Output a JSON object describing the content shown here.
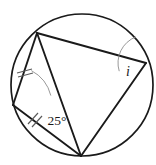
{
  "figure": {
    "type": "geometry-diagram",
    "canvas": {
      "width": 156,
      "height": 165
    },
    "colors": {
      "stroke": "#1a1a1a",
      "background": "#ffffff",
      "arc": "#8d8d8d",
      "tick": "#5a5a5a"
    }
  },
  "circle": {
    "name": "circumscribed-circle",
    "center_x": 82,
    "center_y": 85,
    "radius": 71
  },
  "vertices": [
    {
      "id": "A",
      "role": "top-left-vertex",
      "x": 37,
      "y": 33
    },
    {
      "id": "B",
      "role": "right-vertex",
      "x": 146,
      "y": 63
    },
    {
      "id": "C",
      "role": "bottom-vertex",
      "x": 81,
      "y": 156
    },
    {
      "id": "D",
      "role": "left-vertex",
      "x": 13,
      "y": 105
    }
  ],
  "segments": [
    {
      "name": "chord-top",
      "from": "A",
      "to": "B",
      "ticks": 0
    },
    {
      "name": "chord-right",
      "from": "B",
      "to": "C",
      "ticks": 0
    },
    {
      "name": "chord-bottom-left",
      "from": "C",
      "to": "D",
      "ticks": 2
    },
    {
      "name": "chord-left",
      "from": "D",
      "to": "A",
      "ticks": 2
    },
    {
      "name": "diagonal-a-c",
      "from": "A",
      "to": "C",
      "ticks": 0
    },
    {
      "name": "diagonal-d-... ",
      "from": "D",
      "to": "A",
      "ticks": 0
    }
  ],
  "angles": [
    {
      "name": "angle-25-degrees",
      "label": "25°",
      "value": 25,
      "unit": "degrees",
      "at_vertex": "D",
      "label_x": 57,
      "label_y": 122,
      "arc": {
        "cx": 13,
        "cy": 105,
        "r": 39,
        "start_deg": -62,
        "end_deg": -14
      }
    },
    {
      "name": "angle-i-unknown",
      "label": "i",
      "value": null,
      "unit": "unknown",
      "at_vertex": "B",
      "label_x": 128,
      "label_y": 73,
      "arc": {
        "cx": 146,
        "cy": 63,
        "r": 28,
        "start_deg": 163,
        "end_deg": 249
      }
    }
  ],
  "tick_groups": [
    {
      "name": "tick-chord-left",
      "on_segment": "chord-left",
      "count": 2,
      "marks": [
        {
          "x1": 17,
          "y1": 73,
          "x2": 32,
          "y2": 69
        },
        {
          "x1": 18,
          "y1": 77,
          "x2": 33,
          "y2": 73
        }
      ]
    },
    {
      "name": "tick-chord-bottom-left",
      "on_segment": "chord-bottom-left",
      "count": 2,
      "marks": [
        {
          "x1": 28,
          "y1": 124,
          "x2": 38,
          "y2": 113
        },
        {
          "x1": 32,
          "y1": 127,
          "x2": 42,
          "y2": 116
        }
      ]
    }
  ]
}
